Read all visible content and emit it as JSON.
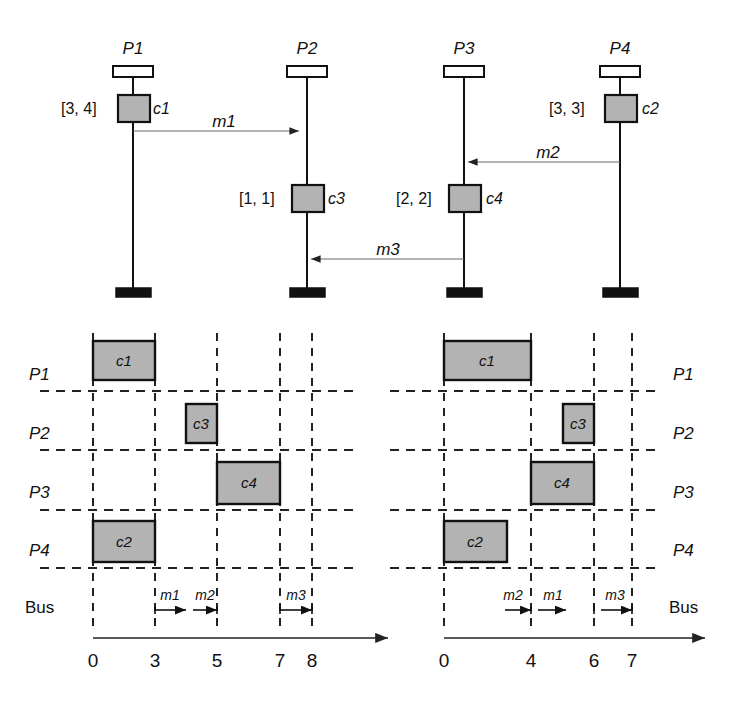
{
  "figure": {
    "kind": "uml-sequence-and-gantt-schedule",
    "colors": {
      "activation_fill": "#b3b3b3",
      "stroke": "#111111",
      "message_line": "#555555",
      "grid_dash": "#222222",
      "background": "#ffffff"
    }
  },
  "sequence": {
    "processes": [
      {
        "id": "P1",
        "label": "P1",
        "x": 133
      },
      {
        "id": "P2",
        "label": "P2",
        "x": 307
      },
      {
        "id": "P3",
        "label": "P3",
        "x": 464
      },
      {
        "id": "P4",
        "label": "P4",
        "x": 620
      }
    ],
    "activations": [
      {
        "id": "c1",
        "label": "c1",
        "process": "P1",
        "interval": "[3, 4]",
        "interval_side": "left",
        "label_side": "right",
        "y_top": 95,
        "y_bottom": 122
      },
      {
        "id": "c3",
        "label": "c3",
        "process": "P2",
        "interval": "[1, 1]",
        "interval_side": "left",
        "label_side": "right",
        "y_top": 185,
        "y_bottom": 212
      },
      {
        "id": "c4",
        "label": "c4",
        "process": "P3",
        "interval": "[2, 2]",
        "interval_side": "left",
        "label_side": "right",
        "y_top": 185,
        "y_bottom": 212
      },
      {
        "id": "c2",
        "label": "c2",
        "process": "P4",
        "interval": "[3, 3]",
        "interval_side": "left",
        "label_side": "right",
        "y_top": 95,
        "y_bottom": 122
      }
    ],
    "messages": [
      {
        "id": "m1",
        "label": "m1",
        "from": "P1",
        "to": "P2",
        "y": 131,
        "direction": "right"
      },
      {
        "id": "m2",
        "label": "m2",
        "from": "P4",
        "to": "P3",
        "y": 162,
        "direction": "left"
      },
      {
        "id": "m3",
        "label": "m3",
        "from": "P3",
        "to": "P2",
        "y": 259,
        "direction": "left"
      }
    ]
  },
  "gantt_left": {
    "rows": [
      {
        "id": "P1",
        "label": "P1"
      },
      {
        "id": "P2",
        "label": "P2"
      },
      {
        "id": "P3",
        "label": "P3"
      },
      {
        "id": "P4",
        "label": "P4"
      },
      {
        "id": "Bus",
        "label": "Bus"
      }
    ],
    "axis": {
      "ticks": [
        0,
        3,
        5,
        7,
        8
      ],
      "tick_labels": [
        "0",
        "3",
        "5",
        "7",
        "8"
      ],
      "min": 0,
      "max": 8
    },
    "tasks": [
      {
        "id": "c1",
        "label": "c1",
        "row": "P1",
        "start": 0,
        "end": 3
      },
      {
        "id": "c3",
        "label": "c3",
        "row": "P2",
        "start": 4,
        "end": 5
      },
      {
        "id": "c4",
        "label": "c4",
        "row": "P3",
        "start": 5,
        "end": 7
      },
      {
        "id": "c2",
        "label": "c2",
        "row": "P4",
        "start": 0,
        "end": 3
      }
    ],
    "bus_messages": [
      {
        "id": "m1",
        "label": "m1",
        "start": 3,
        "end": 4.2
      },
      {
        "id": "m2",
        "label": "m2",
        "start": 4.4,
        "end": 5
      },
      {
        "id": "m3",
        "label": "m3",
        "start": 7,
        "end": 8
      }
    ]
  },
  "gantt_right": {
    "rows": [
      {
        "id": "P1",
        "label": "P1"
      },
      {
        "id": "P2",
        "label": "P2"
      },
      {
        "id": "P3",
        "label": "P3"
      },
      {
        "id": "P4",
        "label": "P4"
      },
      {
        "id": "Bus",
        "label": "Bus"
      }
    ],
    "axis": {
      "ticks": [
        0,
        4,
        6,
        7
      ],
      "tick_labels": [
        "0",
        "4",
        "6",
        "7"
      ],
      "min": 0,
      "max": 7
    },
    "tasks": [
      {
        "id": "c1",
        "label": "c1",
        "row": "P1",
        "start": 0,
        "end": 4
      },
      {
        "id": "c3",
        "label": "c3",
        "row": "P2",
        "start": 5,
        "end": 6
      },
      {
        "id": "c4",
        "label": "c4",
        "row": "P3",
        "start": 4,
        "end": 6
      },
      {
        "id": "c2",
        "label": "c2",
        "row": "P4",
        "start": 0,
        "end": 3
      }
    ],
    "bus_messages": [
      {
        "id": "m2",
        "label": "m2",
        "start": 3,
        "end": 4
      },
      {
        "id": "m1",
        "label": "m1",
        "start": 4.2,
        "end": 5.4
      },
      {
        "id": "m3",
        "label": "m3",
        "start": 6.1,
        "end": 7
      }
    ]
  }
}
